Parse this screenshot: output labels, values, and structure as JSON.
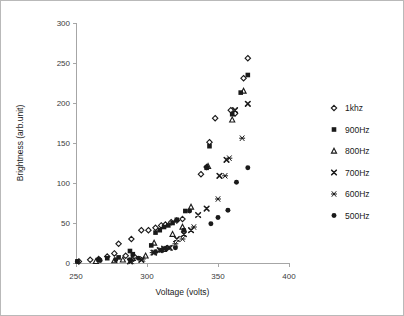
{
  "chart_data": {
    "type": "scatter",
    "title": "",
    "xlabel": "Voltage (volts)",
    "ylabel": "Brightness (arb.unit)",
    "xlim": [
      250,
      400
    ],
    "ylim": [
      0,
      300
    ],
    "xticks": [
      250,
      300,
      350,
      400
    ],
    "yticks": [
      0,
      50,
      100,
      150,
      200,
      250,
      300
    ],
    "grid": false,
    "legend_position": "right",
    "series": [
      {
        "name": "1khz",
        "marker": "open-diamond",
        "color": "#1a1a1a",
        "points": [
          [
            252,
            2
          ],
          [
            260,
            4
          ],
          [
            266,
            5
          ],
          [
            272,
            8
          ],
          [
            277,
            12
          ],
          [
            280,
            24
          ],
          [
            285,
            9
          ],
          [
            289,
            30
          ],
          [
            291,
            8
          ],
          [
            296,
            41
          ],
          [
            301,
            41
          ],
          [
            306,
            44
          ],
          [
            310,
            47
          ],
          [
            313,
            48
          ],
          [
            317,
            51
          ],
          [
            321,
            53
          ],
          [
            325,
            55
          ],
          [
            338,
            111
          ],
          [
            342,
            120
          ],
          [
            344,
            151
          ],
          [
            348,
            181
          ],
          [
            359,
            191
          ],
          [
            362,
            187
          ],
          [
            368,
            231
          ],
          [
            371,
            256
          ]
        ]
      },
      {
        "name": "900Hz",
        "marker": "filled-square",
        "color": "#1a1a1a",
        "points": [
          [
            251,
            2
          ],
          [
            266,
            4
          ],
          [
            272,
            6
          ],
          [
            280,
            7
          ],
          [
            288,
            15
          ],
          [
            290,
            11
          ],
          [
            303,
            22
          ],
          [
            306,
            38
          ],
          [
            309,
            41
          ],
          [
            312,
            45
          ],
          [
            315,
            47
          ],
          [
            318,
            50
          ],
          [
            321,
            54
          ],
          [
            327,
            65
          ],
          [
            342,
            119
          ],
          [
            344,
            146
          ],
          [
            360,
            186
          ],
          [
            366,
            213
          ],
          [
            371,
            235
          ]
        ]
      },
      {
        "name": "800Hz",
        "marker": "open-triangle",
        "color": "#1a1a1a",
        "points": [
          [
            264,
            2
          ],
          [
            277,
            3
          ],
          [
            283,
            4
          ],
          [
            290,
            6
          ],
          [
            299,
            9
          ],
          [
            305,
            25
          ],
          [
            312,
            17
          ],
          [
            318,
            36
          ],
          [
            325,
            45
          ],
          [
            331,
            70
          ],
          [
            343,
            121
          ],
          [
            360,
            179
          ],
          [
            368,
            215
          ]
        ]
      },
      {
        "name": "700Hz",
        "marker": "bold-x",
        "color": "#1a1a1a",
        "points": [
          [
            288,
            2
          ],
          [
            296,
            4
          ],
          [
            305,
            13
          ],
          [
            309,
            16
          ],
          [
            312,
            18
          ],
          [
            316,
            19
          ],
          [
            321,
            30
          ],
          [
            326,
            36
          ],
          [
            331,
            41
          ],
          [
            336,
            60
          ],
          [
            342,
            68
          ],
          [
            351,
            109
          ],
          [
            356,
            129
          ],
          [
            362,
            191
          ],
          [
            371,
            199
          ]
        ]
      },
      {
        "name": "600Hz",
        "marker": "asterisk",
        "color": "#1a1a1a",
        "points": [
          [
            289,
            2
          ],
          [
            297,
            5
          ],
          [
            304,
            13
          ],
          [
            310,
            16
          ],
          [
            315,
            19
          ],
          [
            320,
            24
          ],
          [
            325,
            30
          ],
          [
            333,
            45
          ],
          [
            350,
            80
          ],
          [
            355,
            109
          ],
          [
            358,
            131
          ],
          [
            367,
            156
          ]
        ]
      },
      {
        "name": "500Hz",
        "marker": "filled-circle",
        "color": "#1a1a1a",
        "points": [
          [
            251,
            2
          ],
          [
            267,
            3
          ],
          [
            278,
            4
          ],
          [
            288,
            4
          ],
          [
            294,
            6
          ],
          [
            306,
            14
          ],
          [
            310,
            16
          ],
          [
            313,
            18
          ],
          [
            320,
            19
          ],
          [
            326,
            41
          ],
          [
            330,
            65
          ],
          [
            345,
            49
          ],
          [
            350,
            57
          ],
          [
            357,
            66
          ],
          [
            363,
            101
          ],
          [
            371,
            119
          ]
        ]
      }
    ]
  },
  "legend": {
    "items": [
      {
        "label": "1khz",
        "marker": "open-diamond"
      },
      {
        "label": "900Hz",
        "marker": "filled-square"
      },
      {
        "label": "800Hz",
        "marker": "open-triangle"
      },
      {
        "label": "700Hz",
        "marker": "bold-x"
      },
      {
        "label": "600Hz",
        "marker": "asterisk"
      },
      {
        "label": "500Hz",
        "marker": "filled-circle"
      }
    ]
  },
  "axes": {
    "x_title": "Voltage (volts)",
    "y_title": "Brightness (arb.unit)",
    "x_tick_labels": [
      "250",
      "300",
      "350",
      "400"
    ],
    "y_tick_labels": [
      "0",
      "50",
      "100",
      "150",
      "200",
      "250",
      "300"
    ]
  },
  "colors": {
    "marker": "#1a1a1a",
    "axis": "#a6a6a6",
    "text": "#1a1a1a",
    "border": "#b9b9b9",
    "background": "#ffffff"
  }
}
